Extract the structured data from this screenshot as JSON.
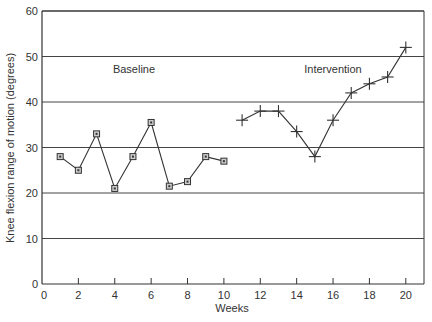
{
  "chart_data": {
    "type": "line",
    "title": "",
    "xlabel": "Weeks",
    "ylabel": "Knee flexion range of motion (degrees)",
    "xlim": [
      0,
      21
    ],
    "ylim": [
      0,
      60
    ],
    "x_ticks": [
      0,
      2,
      4,
      6,
      8,
      10,
      12,
      14,
      16,
      18,
      20
    ],
    "y_ticks": [
      0,
      10,
      20,
      30,
      40,
      50,
      60
    ],
    "grid": "horizontal",
    "legend": "none",
    "annotations": [
      {
        "text": "Baseline",
        "x": 5.5,
        "y": 50
      },
      {
        "text": "Intervention",
        "x": 15.5,
        "y": 50
      }
    ],
    "series": [
      {
        "name": "Baseline",
        "marker": "square",
        "x": [
          1,
          2,
          3,
          4,
          5,
          6,
          7,
          8,
          9,
          10
        ],
        "values": [
          28,
          25,
          33,
          21,
          28,
          35.5,
          21.5,
          22.5,
          28,
          27
        ]
      },
      {
        "name": "Intervention",
        "marker": "plus",
        "x": [
          11,
          12,
          13,
          14,
          15,
          16,
          17,
          18,
          19,
          20
        ],
        "values": [
          36,
          38,
          38,
          33.5,
          28,
          36,
          42,
          44,
          45.5,
          52
        ]
      }
    ]
  },
  "colors": {
    "line": "#333333",
    "grid": "#444444",
    "marker_fill": "#cccccc"
  }
}
